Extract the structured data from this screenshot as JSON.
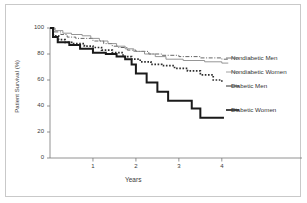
{
  "figure": {
    "background": "#ffffff",
    "border_color": "#c9c9c9"
  },
  "chart_data": {
    "type": "line",
    "title": "",
    "subtitle": "",
    "xlabel": "Years",
    "ylabel": "Patient Survival (%)",
    "xlim": [
      0,
      4.4
    ],
    "ylim": [
      0,
      100
    ],
    "xticks": [
      "1",
      "2",
      "3",
      "4"
    ],
    "xtick_values": [
      1,
      2,
      3,
      4
    ],
    "yticks": [
      "0",
      "20",
      "40",
      "60",
      "80",
      "100"
    ],
    "ytick_values": [
      0,
      20,
      40,
      60,
      80,
      100
    ],
    "grid": false,
    "legend_position": "right-inline",
    "step_style": "kaplan-meier",
    "series": [
      {
        "name": "Nondiabetic Men",
        "style": "dash-dot",
        "color": "#555555",
        "width": 0.9,
        "x": [
          0,
          0.1,
          0.25,
          0.4,
          0.6,
          0.8,
          1.0,
          1.25,
          1.45,
          1.6,
          1.8,
          2.0,
          2.3,
          2.6,
          3.0,
          3.5,
          4.0,
          4.15
        ],
        "y": [
          100,
          97,
          95,
          93,
          92,
          92,
          90,
          88,
          86,
          85,
          83,
          82,
          80,
          79,
          78,
          77,
          76,
          76
        ]
      },
      {
        "name": "Nondiabetic Women",
        "style": "solid-thin",
        "color": "#8a8a8a",
        "width": 0.9,
        "x": [
          0,
          0.12,
          0.3,
          0.5,
          0.75,
          0.95,
          1.15,
          1.35,
          1.55,
          1.75,
          1.95,
          2.2,
          2.45,
          2.7,
          3.1,
          3.6,
          4.0,
          4.15
        ],
        "y": [
          100,
          98,
          96,
          95,
          94,
          92,
          90,
          88,
          86,
          84,
          82,
          80,
          78,
          76,
          75,
          74,
          73,
          73
        ]
      },
      {
        "name": "Diabetic Men",
        "style": "dotted-thick",
        "color": "#2e2e2e",
        "width": 1.7,
        "x": [
          0,
          0.08,
          0.2,
          0.35,
          0.55,
          0.8,
          1.0,
          1.2,
          1.45,
          1.7,
          1.9,
          2.1,
          2.35,
          2.6,
          2.9,
          3.2,
          3.5,
          3.8,
          4.0
        ],
        "y": [
          100,
          94,
          91,
          89,
          88,
          86,
          85,
          83,
          81,
          78,
          76,
          74,
          72,
          71,
          69,
          67,
          64,
          60,
          58
        ]
      },
      {
        "name": "Diabetic Women",
        "style": "solid-thick",
        "color": "#1a1a1a",
        "width": 2.0,
        "x": [
          0,
          0.07,
          0.18,
          0.45,
          0.7,
          1.0,
          1.3,
          1.55,
          1.75,
          1.9,
          2.0,
          2.25,
          2.5,
          2.75,
          3.0,
          3.3,
          3.5,
          4.05
        ],
        "y": [
          100,
          93,
          89,
          87,
          84,
          81,
          80,
          78,
          76,
          72,
          65,
          58,
          51,
          44,
          44,
          38,
          31,
          31
        ]
      }
    ],
    "legend_entries": [
      {
        "label": "Nondiabetic Men",
        "x_px": 231,
        "y_px": 58
      },
      {
        "label": "Nondiabetic Women",
        "x_px": 231,
        "y_px": 72
      },
      {
        "label": "Diabetic Men",
        "x_px": 231,
        "y_px": 86
      },
      {
        "label": "Diabetic Women",
        "x_px": 231,
        "y_px": 110
      }
    ]
  }
}
